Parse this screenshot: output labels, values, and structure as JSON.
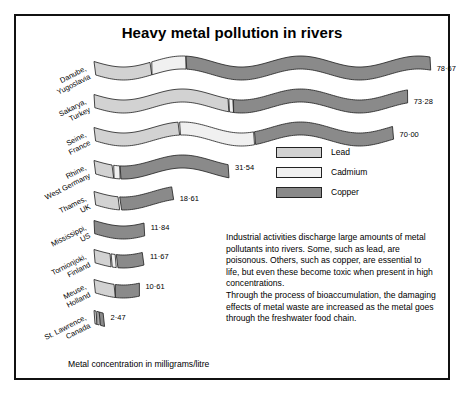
{
  "title": "Heavy metal pollution in rivers",
  "axis_caption": "Metal concentration in milligrams/litre",
  "legend": {
    "items": [
      {
        "label": "Lead",
        "color": "#d2d2d2"
      },
      {
        "label": "Cadmium",
        "color": "#f0f0f0"
      },
      {
        "label": "Copper",
        "color": "#8a8a8a"
      }
    ]
  },
  "note": "Industrial activities discharge large amounts of metal pollutants into rivers. Some, such as lead, are poisonous. Others, such as copper, are essential to life, but even these become toxic when present in high concentrations.\nThrough the process of bioaccumulation, the damaging effects of metal waste are increased as the metal goes through the freshwater food chain.",
  "chart_data": {
    "type": "bar",
    "title": "Heavy metal pollution in rivers",
    "xlabel": "Metal concentration in milligrams/litre",
    "ylabel": "",
    "stacked": true,
    "orientation": "horizontal",
    "legend_position": "middle-right",
    "grid": false,
    "xlim": [
      0,
      80
    ],
    "categories": [
      "Danube, Yugoslavia",
      "Sakarya, Turkey",
      "Seine, France",
      "Rhine, West Germany",
      "Thames, UK",
      "Mississippi, US",
      "Tornionjoki, Finland",
      "Meuse, Holland",
      "St. Lawrence, Canada"
    ],
    "series": [
      {
        "name": "Lead",
        "values": [
          13.5,
          31.5,
          20.0,
          4.6,
          6.0,
          0.0,
          4.0,
          5.0,
          0.7
        ]
      },
      {
        "name": "Cadmium",
        "values": [
          8.0,
          1.1,
          17.5,
          1.5,
          0.0,
          0.0,
          1.2,
          0.0,
          0.5
        ]
      },
      {
        "name": "Copper",
        "values": [
          57.17,
          40.68,
          32.5,
          25.44,
          12.61,
          11.84,
          6.47,
          5.61,
          1.27
        ]
      }
    ],
    "totals": [
      78.67,
      73.28,
      70.0,
      31.54,
      18.61,
      11.84,
      11.67,
      10.61,
      2.47
    ],
    "total_labels": [
      "78·67",
      "73·28",
      "70·00",
      "31·54",
      "18·61",
      "11·84",
      "11·67",
      "10·61",
      "2·47"
    ]
  },
  "rivers": [
    {
      "line1": "Danube,",
      "line2": "Yugoslavia"
    },
    {
      "line1": "Sakarya,",
      "line2": "Turkey"
    },
    {
      "line1": "Seine,",
      "line2": "France"
    },
    {
      "line1": "Rhine,",
      "line2": "West Germany"
    },
    {
      "line1": "Thames,",
      "line2": "UK"
    },
    {
      "line1": "Mississippi,",
      "line2": "US"
    },
    {
      "line1": "Tornionjoki,",
      "line2": "Finland"
    },
    {
      "line1": "Meuse,",
      "line2": "Holland"
    },
    {
      "line1": "St. Lawrence,",
      "line2": "Canada"
    }
  ]
}
